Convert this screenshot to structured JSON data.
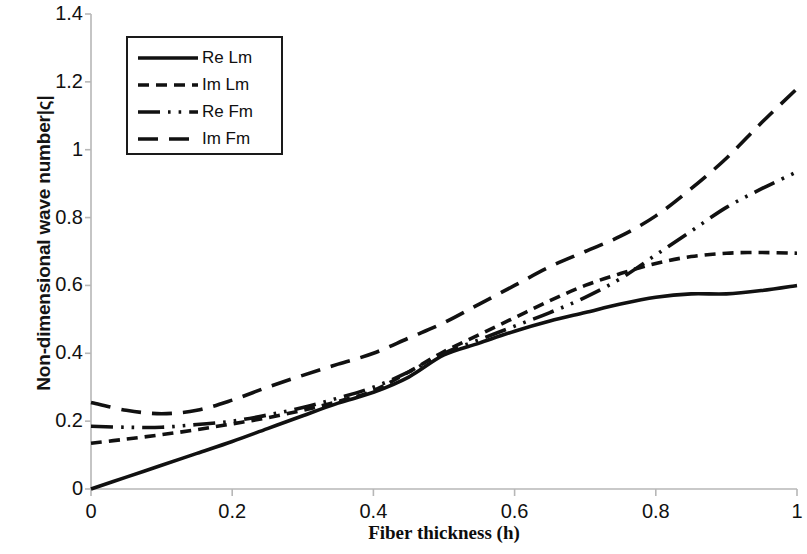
{
  "chart_data": {
    "type": "line",
    "title": "",
    "xlabel": "Fiber thickness (h)",
    "ylabel": "Non-dimensional wave number|ς|",
    "xlim": [
      0,
      1
    ],
    "ylim": [
      0,
      1.4
    ],
    "xticks": [
      "0",
      "0.2",
      "0.4",
      "0.6",
      "0.8",
      "1"
    ],
    "yticks": [
      "0",
      "0.2",
      "0.4",
      "0.6",
      "0.8",
      "1",
      "1.2",
      "1.4"
    ],
    "xtick_values": [
      0,
      0.2,
      0.4,
      0.6,
      0.8,
      1
    ],
    "ytick_values": [
      0,
      0.2,
      0.4,
      0.6,
      0.8,
      1,
      1.2,
      1.4
    ],
    "grid": false,
    "legend_position": "upper left",
    "line_color": "#111111",
    "x": [
      0,
      0.05,
      0.1,
      0.15,
      0.2,
      0.25,
      0.3,
      0.35,
      0.4,
      0.45,
      0.5,
      0.55,
      0.6,
      0.65,
      0.7,
      0.75,
      0.8,
      0.85,
      0.9,
      0.95,
      1
    ],
    "series": [
      {
        "name": "Re Lm",
        "dash": "solid",
        "values": [
          0.0,
          0.035,
          0.07,
          0.105,
          0.14,
          0.178,
          0.216,
          0.253,
          0.285,
          0.33,
          0.395,
          0.43,
          0.465,
          0.495,
          0.52,
          0.545,
          0.565,
          0.575,
          0.575,
          0.585,
          0.6
        ]
      },
      {
        "name": "Im Lm",
        "dash": "dotted",
        "values": [
          0.135,
          0.147,
          0.16,
          0.175,
          0.192,
          0.21,
          0.232,
          0.258,
          0.29,
          0.345,
          0.405,
          0.455,
          0.505,
          0.555,
          0.6,
          0.635,
          0.665,
          0.685,
          0.695,
          0.697,
          0.695
        ]
      },
      {
        "name": "Re Fm",
        "dash": "dashdotdot",
        "values": [
          0.185,
          0.182,
          0.182,
          0.19,
          0.2,
          0.218,
          0.24,
          0.268,
          0.3,
          0.345,
          0.4,
          0.44,
          0.48,
          0.52,
          0.565,
          0.62,
          0.69,
          0.76,
          0.83,
          0.885,
          0.935
        ]
      },
      {
        "name": "Im Fm",
        "dash": "dashed",
        "values": [
          0.255,
          0.232,
          0.222,
          0.232,
          0.262,
          0.3,
          0.335,
          0.368,
          0.4,
          0.445,
          0.49,
          0.545,
          0.6,
          0.655,
          0.7,
          0.745,
          0.805,
          0.885,
          0.975,
          1.08,
          1.18
        ]
      }
    ]
  },
  "legend": {
    "items": [
      {
        "label": "Re Lm",
        "style": "solid"
      },
      {
        "label": "Im Lm",
        "style": "dotted"
      },
      {
        "label": "Re Fm",
        "style": "dashdotdot"
      },
      {
        "label": "Im Fm",
        "style": "dashed"
      }
    ]
  }
}
